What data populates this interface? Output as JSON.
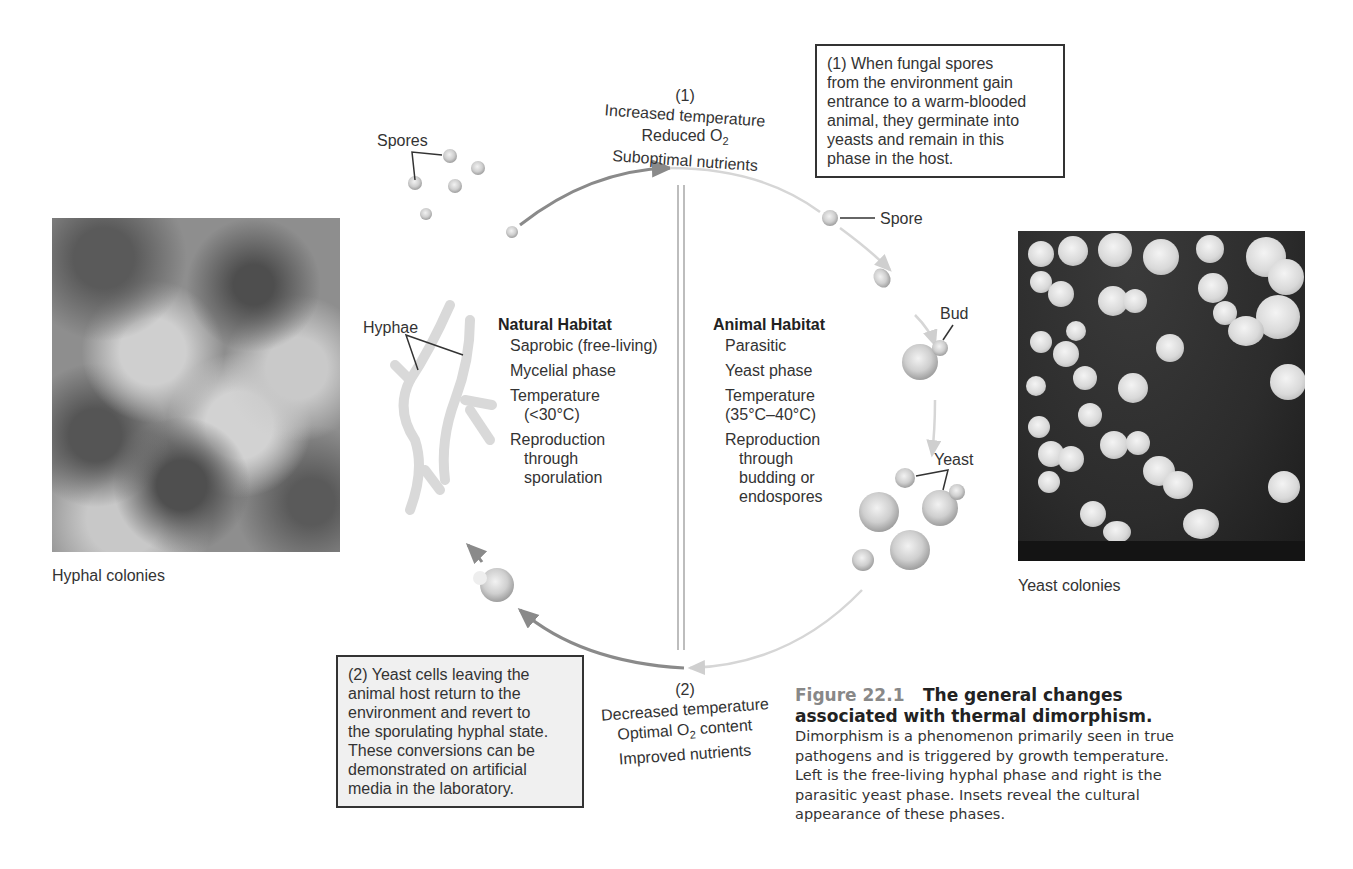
{
  "figure": {
    "number": "Figure 22.1",
    "title": "The general changes associated with thermal dimorphism.",
    "caption_body": "Dimorphism is a phenomenon primarily seen in true pathogens and is triggered by growth temperature. Left is the free-living hyphal phase and right is the parasitic yeast phase. Insets reveal the cultural appearance of these phases."
  },
  "insets": {
    "left": {
      "label": "Hyphal colonies",
      "icon": "hyphal-colonies-photo"
    },
    "right": {
      "label": "Yeast colonies",
      "icon": "yeast-colonies-photo"
    }
  },
  "transition_top": {
    "number": "(1)",
    "line1": "Increased temperature",
    "line2_prefix": "Reduced O",
    "line2_sub": "2",
    "line3": "Suboptimal nutrients"
  },
  "transition_bottom": {
    "number": "(2)",
    "line1": "Decreased temperature",
    "line2_prefix": "Optimal O",
    "line2_sub": "2",
    "line2_suffix": " content",
    "line3": "Improved nutrients"
  },
  "note_top": {
    "lines": [
      "(1) When fungal spores",
      "from the environment gain",
      "entrance to a warm-blooded",
      "animal, they germinate into",
      "yeasts and remain in this",
      "phase in the host."
    ]
  },
  "note_bottom": {
    "lines": [
      "(2) Yeast cells leaving the",
      "animal host return to the",
      "environment and revert to",
      "the sporulating hyphal state.",
      "These conversions can be",
      "demonstrated on artificial",
      "media in the laboratory."
    ]
  },
  "natural_habitat": {
    "title": "Natural Habitat",
    "lines": [
      "Saprobic (free-living)",
      "Mycelial phase",
      "Temperature",
      "(<30°C)",
      "Reproduction",
      "through",
      "sporulation"
    ]
  },
  "animal_habitat": {
    "title": "Animal Habitat",
    "lines": [
      "Parasitic",
      "Yeast phase",
      "Temperature",
      "(35°C–40°C)",
      "Reproduction",
      "through",
      "budding or",
      "endospores"
    ]
  },
  "labels": {
    "spores": "Spores",
    "spore": "Spore",
    "bud": "Bud",
    "yeast": "Yeast",
    "hyphae": "Hyphae"
  },
  "colors": {
    "arrow_dark": "#8a8a8a",
    "arrow_light": "#cfcfcf",
    "caption_figure_number": "#888888",
    "box_border": "#333333",
    "box_gray_fill": "#f0f0f0"
  }
}
